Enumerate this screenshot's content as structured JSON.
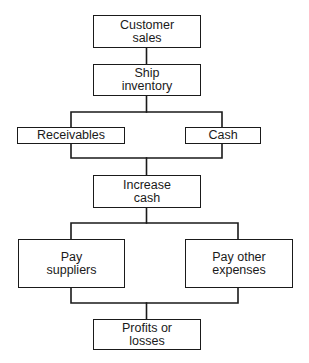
{
  "diagram": {
    "type": "flowchart",
    "nodes": {
      "customer_sales": {
        "label": "Customer\nsales"
      },
      "ship_inventory": {
        "label": "Ship\ninventory"
      },
      "receivables": {
        "label": "Receivables"
      },
      "cash": {
        "label": "Cash"
      },
      "increase_cash": {
        "label": "Increase\ncash"
      },
      "pay_suppliers": {
        "label": "Pay\nsuppliers"
      },
      "pay_other_expenses": {
        "label": "Pay other\nexpenses"
      },
      "profits_or_losses": {
        "label": "Profits or\nlosses"
      }
    },
    "edges": [
      {
        "from": "Customer sales",
        "to": "Ship inventory"
      },
      {
        "from": "Ship inventory",
        "to": "Receivables"
      },
      {
        "from": "Ship inventory",
        "to": "Cash"
      },
      {
        "from": "Receivables",
        "to": "Increase cash"
      },
      {
        "from": "Cash",
        "to": "Increase cash"
      },
      {
        "from": "Increase cash",
        "to": "Pay suppliers"
      },
      {
        "from": "Increase cash",
        "to": "Pay other expenses"
      },
      {
        "from": "Pay suppliers",
        "to": "Profits or losses"
      },
      {
        "from": "Pay other expenses",
        "to": "Profits or losses"
      }
    ],
    "colors": {
      "line": "#1a1a1a",
      "background": "#ffffff"
    }
  }
}
